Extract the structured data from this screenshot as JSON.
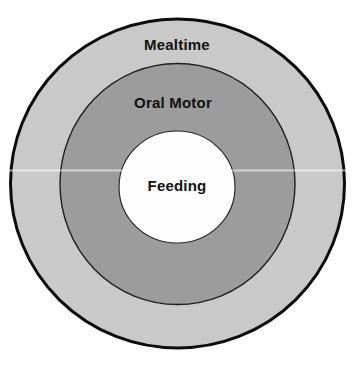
{
  "page": {
    "background": "#ffffff"
  },
  "diagram": {
    "type": "concentric-circles",
    "text_color": "#111111",
    "rings": [
      {
        "id": "mealtime",
        "label": "Mealtime",
        "fill": "#c9c9c9",
        "stroke": "#0d0d0d"
      },
      {
        "id": "oral-motor",
        "label": "Oral Motor",
        "fill": "#9c9c9c",
        "stroke": "#1f1f1f"
      },
      {
        "id": "feeding",
        "label": "Feeding",
        "fill": "#fefefe",
        "stroke": "#2b2b2b"
      }
    ]
  }
}
